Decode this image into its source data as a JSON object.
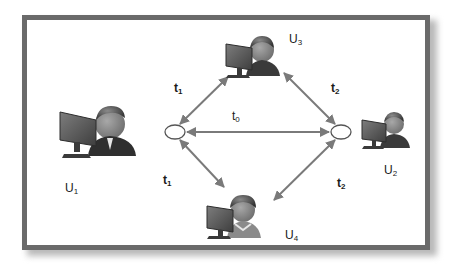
{
  "diagram": {
    "type": "network-topology",
    "nodes": {
      "left_hub": {
        "shape": "ellipse",
        "cx": 175,
        "cy": 132
      },
      "right_hub": {
        "shape": "ellipse",
        "cx": 341,
        "cy": 132
      }
    },
    "users": [
      {
        "id": "U1",
        "label": "U",
        "sub": "1",
        "position": "left"
      },
      {
        "id": "U2",
        "label": "U",
        "sub": "2",
        "position": "right"
      },
      {
        "id": "U3",
        "label": "U",
        "sub": "3",
        "position": "top"
      },
      {
        "id": "U4",
        "label": "U",
        "sub": "4",
        "position": "bottom"
      }
    ],
    "edges": [
      {
        "from": "left_hub",
        "to": "U3",
        "label": "t",
        "sub": "1",
        "bidirectional": true
      },
      {
        "from": "right_hub",
        "to": "U3",
        "label": "t",
        "sub": "2",
        "bidirectional": true
      },
      {
        "from": "left_hub",
        "to": "right_hub",
        "label": "t",
        "sub": "0",
        "bidirectional": true
      },
      {
        "from": "left_hub",
        "to": "U4",
        "label": "t",
        "sub": "1",
        "bidirectional": true
      },
      {
        "from": "right_hub",
        "to": "U4",
        "label": "t",
        "sub": "2",
        "bidirectional": true
      }
    ],
    "colors": {
      "frame": "#6a6a6a",
      "arrow": "#7a7a7a",
      "text": "#1a1a1a",
      "monitor": "#5b5b5b",
      "person": "#3a3a3a"
    }
  }
}
